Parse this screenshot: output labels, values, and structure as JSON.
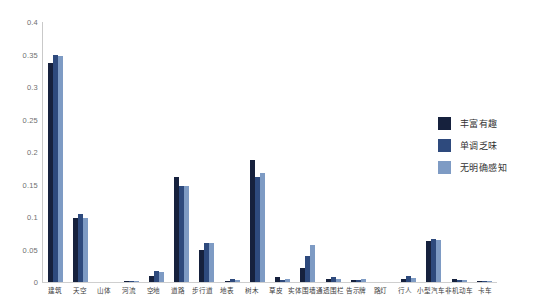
{
  "chart_data": {
    "type": "bar",
    "title": "",
    "subtitle": "",
    "xlabel": "",
    "ylabel": "",
    "ylim": [
      0,
      0.4
    ],
    "grid": false,
    "legend_position": "right",
    "yticks": [
      "0.4",
      "0.35",
      "0.3",
      "0.25",
      "0.2",
      "0.15",
      "0.1",
      "0.05",
      "0"
    ],
    "ytick_values": [
      0.4,
      0.35,
      0.3,
      0.25,
      0.2,
      0.15,
      0.1,
      0.05,
      0
    ],
    "categories": [
      "建筑",
      "天空",
      "山体",
      "河流",
      "空地",
      "道路",
      "步行道",
      "地表",
      "树木",
      "草皮",
      "实体围墙",
      "通透围栏",
      "告示牌",
      "路灯",
      "行人",
      "小型汽车",
      "非机动车",
      "卡车"
    ],
    "series": [
      {
        "name": "丰富有趣",
        "color": "#16213d",
        "values": [
          0.337,
          0.099,
          0.0,
          0.001,
          0.01,
          0.162,
          0.05,
          0.001,
          0.187,
          0.007,
          0.021,
          0.005,
          0.003,
          0.0,
          0.004,
          0.063,
          0.004,
          0.001
        ]
      },
      {
        "name": "单调乏味",
        "color": "#2e4a7d",
        "values": [
          0.349,
          0.105,
          0.0,
          0.001,
          0.017,
          0.147,
          0.06,
          0.004,
          0.161,
          0.003,
          0.04,
          0.007,
          0.003,
          0.0,
          0.01,
          0.066,
          0.003,
          0.001
        ]
      },
      {
        "name": "无明确感知",
        "color": "#7e9bc4",
        "values": [
          0.347,
          0.098,
          0.0,
          0.001,
          0.015,
          0.147,
          0.06,
          0.003,
          0.168,
          0.004,
          0.057,
          0.005,
          0.004,
          0.0,
          0.006,
          0.065,
          0.003,
          0.001
        ]
      }
    ]
  },
  "legend": {
    "items": [
      {
        "label": "丰富有趣",
        "color": "#16213d"
      },
      {
        "label": "单调乏味",
        "color": "#2e4a7d"
      },
      {
        "label": "无明确感知",
        "color": "#7e9bc4"
      }
    ]
  }
}
